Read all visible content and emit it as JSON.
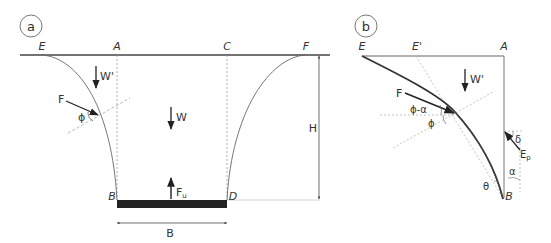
{
  "panel_a": {
    "label": "a",
    "points": {
      "E": "E",
      "A": "A",
      "C": "C",
      "F": "F",
      "B": "B",
      "D": "D"
    },
    "forces": {
      "W_prime": "W'",
      "W": "W",
      "F": "F",
      "F_u": "F",
      "F_u_sub": "u"
    },
    "angle": "ϕ",
    "dimensions": {
      "width": "B",
      "height": "H"
    }
  },
  "panel_b": {
    "label": "b",
    "points": {
      "E": "E",
      "E_prime": "E'",
      "A": "A",
      "B": "B"
    },
    "forces": {
      "W_prime": "W'",
      "F": "F",
      "E_p": "E",
      "E_p_sub": "p"
    },
    "angles": {
      "phi_minus_alpha": "ϕ-α",
      "phi": "ϕ",
      "delta": "δ",
      "alpha": "α",
      "theta": "θ"
    }
  },
  "colors": {
    "line": "#333333",
    "guide": "#999999",
    "bar": "#222222"
  }
}
